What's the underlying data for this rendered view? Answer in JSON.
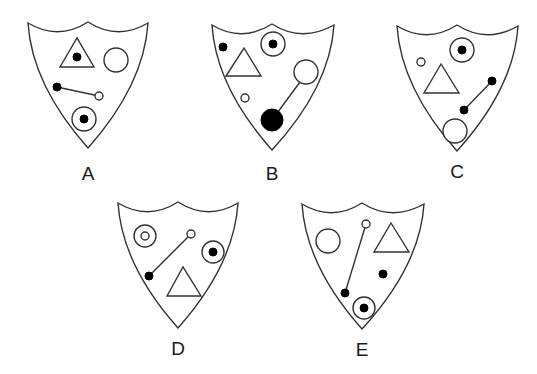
{
  "puzzle": {
    "description": "Odd-one-out shield puzzle with five shields labeled A-E",
    "colors": {
      "stroke": "#333333",
      "fill": "#000000",
      "background": "#ffffff"
    },
    "shields": [
      {
        "label": "A",
        "outline": [
          [
            28,
            23
          ],
          [
            58,
            33
          ],
          [
            88,
            22
          ],
          [
            118,
            33
          ],
          [
            148,
            23
          ],
          [
            140,
            95
          ],
          [
            88,
            148
          ],
          [
            36,
            95
          ]
        ],
        "label_pos": [
          88,
          180
        ],
        "triangles": [
          {
            "pts": [
              [
                60,
                67
              ],
              [
                77,
                38
              ],
              [
                94,
                67
              ]
            ],
            "dot": [
              77,
              57,
              4
            ]
          }
        ],
        "open_circles": [
          [
            116,
            60,
            12
          ]
        ],
        "targets": [
          [
            84,
            119,
            12,
            4
          ]
        ],
        "solid_dots": [],
        "lines": [
          {
            "from": [
              57,
              87
            ],
            "to": [
              99,
              96
            ],
            "from_style": "solid",
            "from_r": 4,
            "to_style": "open",
            "to_r": 4
          }
        ]
      },
      {
        "label": "B",
        "outline": [
          [
            212,
            25
          ],
          [
            242,
            35
          ],
          [
            272,
            24
          ],
          [
            302,
            35
          ],
          [
            334,
            25
          ],
          [
            326,
            97
          ],
          [
            272,
            150
          ],
          [
            220,
            97
          ]
        ],
        "label_pos": [
          272,
          180
        ],
        "triangles": [
          {
            "pts": [
              [
                226,
                76
              ],
              [
                244,
                48
              ],
              [
                261,
                76
              ]
            ]
          }
        ],
        "open_circles": [
          [
            306,
            72,
            12
          ],
          [
            245,
            98,
            4
          ]
        ],
        "targets": [
          [
            273,
            44,
            12,
            4
          ]
        ],
        "solid_dots": [
          [
            223,
            47,
            4
          ]
        ],
        "lines": [
          {
            "from": [
              272,
              120
            ],
            "to": [
              300,
              82
            ],
            "from_style": "solid",
            "from_r": 11,
            "to_style": "none",
            "to_r": 0
          }
        ]
      },
      {
        "label": "C",
        "outline": [
          [
            397,
            26
          ],
          [
            427,
            36
          ],
          [
            457,
            25
          ],
          [
            487,
            36
          ],
          [
            518,
            26
          ],
          [
            510,
            98
          ],
          [
            457,
            151
          ],
          [
            405,
            98
          ]
        ],
        "label_pos": [
          457,
          178
        ],
        "triangles": [
          {
            "pts": [
              [
                424,
                93
              ],
              [
                441,
                64
              ],
              [
                459,
                93
              ]
            ]
          }
        ],
        "open_circles": [
          [
            455,
            131,
            12
          ],
          [
            421,
            62,
            4
          ]
        ],
        "targets": [
          [
            462,
            50,
            12,
            4
          ]
        ],
        "solid_dots": [],
        "lines": [
          {
            "from": [
              492,
              81
            ],
            "to": [
              464,
              110
            ],
            "from_style": "solid",
            "from_r": 4,
            "to_style": "solid",
            "to_r": 4
          }
        ]
      },
      {
        "label": "D",
        "outline": [
          [
            118,
            203
          ],
          [
            148,
            213
          ],
          [
            178,
            202
          ],
          [
            208,
            213
          ],
          [
            238,
            203
          ],
          [
            230,
            275
          ],
          [
            178,
            328
          ],
          [
            126,
            275
          ]
        ],
        "label_pos": [
          178,
          355
        ],
        "triangles": [
          {
            "pts": [
              [
                167,
                296
              ],
              [
                183,
                267
              ],
              [
                201,
                296
              ]
            ]
          }
        ],
        "open_circles": [],
        "double_circles": [
          [
            145,
            236,
            11,
            4
          ]
        ],
        "targets": [
          [
            213,
            252,
            11,
            4
          ]
        ],
        "solid_dots": [],
        "lines": [
          {
            "from": [
              191,
              234
            ],
            "to": [
              149,
              276
            ],
            "from_style": "open",
            "from_r": 4,
            "to_style": "solid",
            "to_r": 4
          }
        ]
      },
      {
        "label": "E",
        "outline": [
          [
            302,
            204
          ],
          [
            332,
            214
          ],
          [
            362,
            203
          ],
          [
            392,
            214
          ],
          [
            424,
            204
          ],
          [
            416,
            276
          ],
          [
            362,
            329
          ],
          [
            310,
            276
          ]
        ],
        "label_pos": [
          362,
          356
        ],
        "triangles": [
          {
            "pts": [
              [
                374,
                252
              ],
              [
                391,
                223
              ],
              [
                409,
                252
              ]
            ]
          }
        ],
        "open_circles": [
          [
            328,
            241,
            12
          ]
        ],
        "targets": [
          [
            364,
            308,
            11,
            4
          ]
        ],
        "solid_dots": [
          [
            383,
            274,
            4
          ]
        ],
        "lines": [
          {
            "from": [
              366,
              224
            ],
            "to": [
              345,
              293
            ],
            "from_style": "open",
            "from_r": 4,
            "to_style": "solid",
            "to_r": 4
          }
        ]
      }
    ]
  }
}
